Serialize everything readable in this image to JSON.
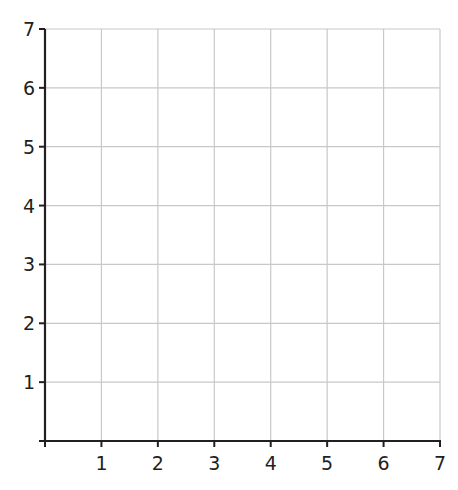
{
  "chart_data": {
    "type": "scatter",
    "title": "",
    "subtitle": "",
    "xlabel": "",
    "ylabel": "",
    "x": [],
    "series": [],
    "xlim": [
      0,
      7
    ],
    "ylim": [
      0,
      7
    ],
    "x_ticks": [
      1,
      2,
      3,
      4,
      5,
      6,
      7
    ],
    "y_ticks": [
      1,
      2,
      3,
      4,
      5,
      6,
      7
    ],
    "x_tick_labels": [
      "1",
      "2",
      "3",
      "4",
      "5",
      "6",
      "7"
    ],
    "y_tick_labels": [
      "1",
      "2",
      "3",
      "4",
      "5",
      "6",
      "7"
    ],
    "grid": true,
    "legend": null
  },
  "colors": {
    "axis": "#231f20",
    "grid": "#c8c8c8",
    "background": "#ffffff",
    "label": "#231f20"
  },
  "layout": {
    "plot_left": 45,
    "plot_right": 440,
    "plot_top": 29,
    "plot_bottom": 441
  }
}
